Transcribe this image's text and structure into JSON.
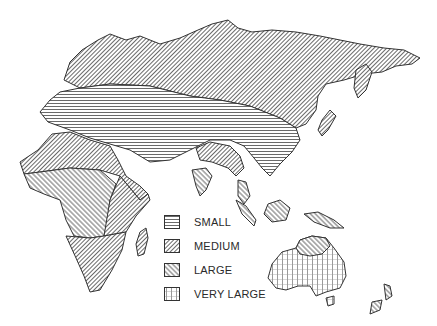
{
  "map": {
    "region": "Eastern Hemisphere (Eurasia, Africa, Australia)",
    "patterns": {
      "small": "horizontal-lines",
      "medium": "diagonal-backslash-dense",
      "large": "diagonal-slash",
      "very_large": "grid"
    },
    "zones": [
      {
        "area": "Northern Eurasia",
        "category": "MEDIUM"
      },
      {
        "area": "Central Eurasia / Europe / Middle East / China",
        "category": "SMALL"
      },
      {
        "area": "Northern India",
        "category": "MEDIUM"
      },
      {
        "area": "Southern India / Southeast Asia / Indonesia",
        "category": "LARGE"
      },
      {
        "area": "North Africa",
        "category": "MEDIUM"
      },
      {
        "area": "Central Africa",
        "category": "LARGE"
      },
      {
        "area": "Southern Africa",
        "category": "MEDIUM"
      },
      {
        "area": "Northern Australia",
        "category": "LARGE"
      },
      {
        "area": "Australia (most)",
        "category": "VERY LARGE"
      },
      {
        "area": "New Zealand",
        "category": "LARGE"
      }
    ]
  },
  "legend": {
    "items": [
      {
        "label": "SMALL",
        "pattern": "horizontal-lines"
      },
      {
        "label": "MEDIUM",
        "pattern": "diagonal-backslash-dense"
      },
      {
        "label": "LARGE",
        "pattern": "diagonal-slash"
      },
      {
        "label": "VERY LARGE",
        "pattern": "grid"
      }
    ]
  },
  "colors": {
    "ink": "#333333",
    "paper": "#ffffff"
  }
}
